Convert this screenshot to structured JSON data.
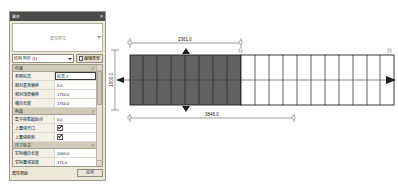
{
  "panel": {
    "title": "属性",
    "close_label": "×",
    "preview_text": "属性预览",
    "selector": {
      "value": "结构 构件 (1)",
      "edit_button": "编辑类型"
    },
    "groups": [
      {
        "name": "约束",
        "toggle": "≡",
        "rows": [
          {
            "key": "参照标高",
            "value": "标高 1",
            "selected": true
          },
          {
            "key": "相对基准偏移",
            "value": "0.0",
            "selected": false
          },
          {
            "key": "相对顶部偏移",
            "value": "1750.0",
            "selected": false
          },
          {
            "key": "横向长度",
            "value": "1750.0",
            "selected": false
          }
        ]
      },
      {
        "name": "构造",
        "toggle": "≡",
        "rows": [
          {
            "key": "集中荷载起始点",
            "value": "0.0",
            "selected": false
          },
          {
            "key": "上翼缘开口",
            "value": "check",
            "selected": false
          },
          {
            "key": "上翼缘削剪",
            "value": "check",
            "selected": false
          }
        ]
      },
      {
        "name": "尺寸标注",
        "toggle": "≡",
        "rows": [
          {
            "key": "实际横向长度",
            "value": "1000.0",
            "selected": false
          },
          {
            "key": "实际翼缘宽度",
            "value": "171.0",
            "selected": false
          },
          {
            "key": "实际腹板厚度",
            "value": "290.0",
            "selected": false
          },
          {
            "key": "实际翼缘数",
            "value": "10",
            "selected": false
          },
          {
            "key": "实际腹板数",
            "value": "9",
            "selected": false
          }
        ]
      }
    ],
    "footer": {
      "help_link": "属性帮助",
      "ok_button": "应用"
    }
  },
  "drawing": {
    "dim_top": "2361.0",
    "dim_bottom": "3846.0",
    "dim_left": "1000.0",
    "node_labels": [
      "A",
      "B",
      "C",
      "D"
    ]
  }
}
